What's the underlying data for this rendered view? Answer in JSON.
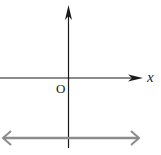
{
  "diagram": {
    "type": "coordinate-axes",
    "x_axis_label": "x",
    "origin_label": "O",
    "y_axis_label": "",
    "line": {
      "description": "horizontal line below x-axis, arrows both directions",
      "color": "#8c8c8c"
    },
    "axis_color": "#1a1a1a"
  }
}
